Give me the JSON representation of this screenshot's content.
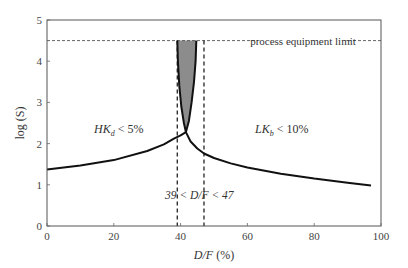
{
  "chart_data": {
    "type": "line",
    "title": "",
    "xlabel": "D/F (%)",
    "ylabel": "log (S)",
    "xlim": [
      0,
      100
    ],
    "ylim": [
      0,
      5
    ],
    "xticks": [
      0,
      20,
      40,
      60,
      80,
      100
    ],
    "yticks": [
      0,
      1,
      2,
      3,
      4,
      5
    ],
    "grid": false,
    "legend": null,
    "series": [
      {
        "name": "HK_d < 5% constraint",
        "style": "solid",
        "color": "#111111",
        "x": [
          0,
          10,
          20,
          30,
          35,
          38,
          40,
          41.6,
          42.5,
          43.3,
          44,
          44.5,
          44.7
        ],
        "y": [
          1.37,
          1.47,
          1.6,
          1.82,
          1.98,
          2.12,
          2.2,
          2.28,
          2.55,
          3.0,
          3.5,
          4.0,
          4.5
        ]
      },
      {
        "name": "LK_b < 10% constraint",
        "style": "solid",
        "color": "#111111",
        "x": [
          39.0,
          39.2,
          39.6,
          40.2,
          41.0,
          41.6,
          43,
          45,
          47,
          50,
          55,
          60,
          70,
          80,
          90,
          97
        ],
        "y": [
          4.5,
          4.0,
          3.4,
          2.9,
          2.5,
          2.28,
          2.05,
          1.88,
          1.76,
          1.65,
          1.52,
          1.42,
          1.27,
          1.15,
          1.05,
          0.98
        ]
      }
    ],
    "reference_lines": [
      {
        "type": "horizontal",
        "y": 4.5,
        "style": "dashed",
        "label": "process equipment limit"
      },
      {
        "type": "vertical",
        "x": 39,
        "style": "dashed"
      },
      {
        "type": "vertical",
        "x": 47,
        "style": "dashed"
      }
    ],
    "shaded_region": {
      "description": "feasible region between curves below equipment limit",
      "color": "#8c8c8c",
      "x_range": [
        39,
        47
      ],
      "y_top": 4.5
    },
    "annotations": [
      {
        "text_main": "HK",
        "sub": "d",
        "text_rest": " < 5%",
        "x": 12,
        "y": 2.6
      },
      {
        "text_main": "LK",
        "sub": "b",
        "text_rest": " < 10%",
        "x": 60,
        "y": 2.6
      },
      {
        "text": "39 < D/F < 47",
        "x": 43,
        "y": 0.45
      },
      {
        "text": "process equipment limit",
        "x": 72,
        "y": 4.62
      }
    ]
  },
  "labels": {
    "xlabel_italic": "D/F",
    "xlabel_rest": " (%)",
    "ylabel": "log (S)",
    "equipment_limit": "process equipment limit",
    "hk_main": "HK",
    "hk_sub": "d",
    "hk_rest": " < 5%",
    "lk_main": "LK",
    "lk_sub": "b",
    "lk_rest": " < 10%",
    "range_pre": "39 < ",
    "range_italic": "D/F",
    "range_post": " < 47"
  }
}
